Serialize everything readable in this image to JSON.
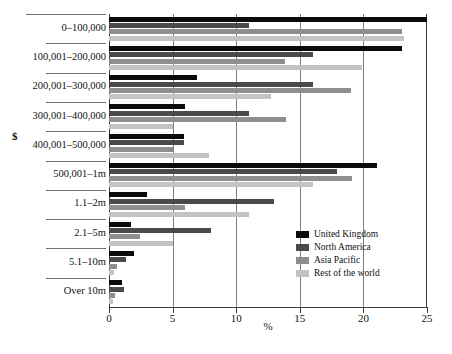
{
  "chart_data": {
    "type": "bar",
    "orientation": "horizontal",
    "title": "",
    "xlabel": "%",
    "ylabel": "$",
    "xlim": [
      0,
      25
    ],
    "xticks": [
      0,
      5,
      10,
      15,
      20,
      25
    ],
    "grid": true,
    "legend_position": "inside-right",
    "categories": [
      "0–100,000",
      "100,001–200,000",
      "200,001–300,000",
      "300,001–400,000",
      "400,001–500,000",
      "500,001–1m",
      "1.1–2m",
      "2.1–5m",
      "5.1–10m",
      "Over 10m"
    ],
    "series": [
      {
        "name": "United Kingdom",
        "color": "#0b0b0b",
        "values": [
          25.0,
          23.0,
          6.9,
          6.0,
          5.9,
          21.1,
          3.0,
          1.7,
          2.0,
          1.0
        ]
      },
      {
        "name": "North America",
        "color": "#4a4a4a",
        "values": [
          11.0,
          16.0,
          16.0,
          11.0,
          5.9,
          17.9,
          13.0,
          8.0,
          1.3,
          1.2
        ]
      },
      {
        "name": "Asia Pacific",
        "color": "#8e8e8e",
        "values": [
          23.0,
          13.8,
          19.0,
          13.9,
          5.0,
          19.1,
          6.0,
          2.4,
          0.6,
          0.5
        ]
      },
      {
        "name": "Rest of the world",
        "color": "#c3c3c3",
        "values": [
          23.2,
          19.9,
          12.7,
          5.0,
          7.9,
          16.0,
          11.0,
          5.0,
          0.4,
          0.3
        ]
      }
    ]
  },
  "axis": {
    "x_tick_labels": [
      "0",
      "5",
      "10",
      "15",
      "20",
      "25"
    ],
    "x_axis_title": "%",
    "y_axis_title": "$"
  },
  "legend": {
    "items": [
      {
        "label": "United Kingdom",
        "color": "#0b0b0b"
      },
      {
        "label": "North America",
        "color": "#4a4a4a"
      },
      {
        "label": "Asia Pacific",
        "color": "#8e8e8e"
      },
      {
        "label": "Rest of the world",
        "color": "#c3c3c3"
      }
    ]
  }
}
